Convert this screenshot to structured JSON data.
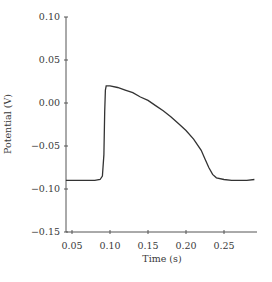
{
  "chart_data": {
    "type": "line",
    "title": "",
    "xlabel": "Time (s)",
    "ylabel": "Potential (V)",
    "xlim": [
      0.042,
      0.295
    ],
    "ylim": [
      -0.15,
      0.1
    ],
    "xticks": [
      0.05,
      0.1,
      0.15,
      0.2,
      0.25
    ],
    "xtick_labels": [
      "0.05",
      "0.10",
      "0.15",
      "0.20",
      "0.25"
    ],
    "yticks": [
      0.1,
      0.05,
      0.0,
      -0.05,
      -0.1,
      -0.15
    ],
    "ytick_labels": [
      "0.10",
      "0.05",
      "0.00",
      "−0.05",
      "−0.10",
      "−0.15"
    ],
    "grid": false,
    "legend": null,
    "series": [
      {
        "name": "Action potential",
        "color": "#333333",
        "x": [
          0.042,
          0.06,
          0.08,
          0.087,
          0.09,
          0.092,
          0.093,
          0.094,
          0.095,
          0.1,
          0.11,
          0.12,
          0.13,
          0.14,
          0.15,
          0.16,
          0.17,
          0.18,
          0.19,
          0.2,
          0.21,
          0.22,
          0.225,
          0.23,
          0.235,
          0.24,
          0.25,
          0.26,
          0.27,
          0.28,
          0.29
        ],
        "y": [
          -0.09,
          -0.09,
          -0.09,
          -0.089,
          -0.085,
          -0.06,
          -0.01,
          0.015,
          0.02,
          0.02,
          0.018,
          0.015,
          0.012,
          0.007,
          0.003,
          -0.003,
          -0.009,
          -0.016,
          -0.024,
          -0.032,
          -0.042,
          -0.055,
          -0.065,
          -0.075,
          -0.083,
          -0.087,
          -0.089,
          -0.09,
          -0.09,
          -0.09,
          -0.089
        ]
      }
    ]
  }
}
